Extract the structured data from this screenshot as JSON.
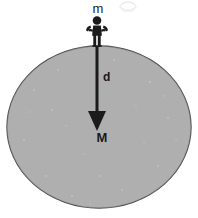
{
  "figure": {
    "background_color": "#ffffff",
    "planet": {
      "name": "planet-ellipse",
      "fill_color": "#ababab",
      "stroke_color": "#4a4a4a",
      "center_x": 99,
      "center_y": 127,
      "radius_x": 92,
      "radius_y": 81
    },
    "person": {
      "name": "person-figure",
      "color": "#1b1b1b",
      "x": 97,
      "y": 14,
      "height": 32
    },
    "arrow": {
      "name": "distance-arrow",
      "color": "#1b1b1b",
      "from_x": 97,
      "from_y": 47,
      "to_x": 97,
      "to_y": 130,
      "shaft_width": 3,
      "head_width": 18,
      "head_length": 20
    },
    "labels": {
      "mass_small": "m",
      "distance": "d",
      "mass_large": "M"
    },
    "artifact": {
      "name": "faint-mark",
      "color": "#ededed",
      "x": 124,
      "y": 3
    }
  }
}
